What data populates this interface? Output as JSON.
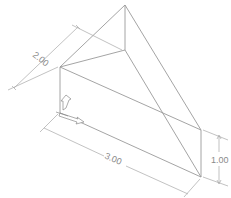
{
  "drawing": {
    "type": "isometric wedge with dimensions",
    "line_color": "#9a9a9a",
    "background": "#ffffff"
  },
  "dimensions": {
    "depth": {
      "label": "2.00"
    },
    "length": {
      "label": "3.00"
    },
    "height": {
      "label": "1.00"
    }
  },
  "icons": {
    "ucs": "ucs-axis-icon"
  }
}
